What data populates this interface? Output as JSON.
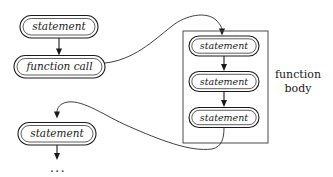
{
  "diagram": {
    "colors": {
      "stroke": "#1a1a1a",
      "group_stroke": "#4a4a4a",
      "background": "#ffffff"
    },
    "caller": {
      "nodes": [
        {
          "id": "caller-statement-1",
          "label": "statement",
          "kind": "statement"
        },
        {
          "id": "caller-function-call",
          "label": "function call",
          "kind": "call"
        },
        {
          "id": "caller-statement-2",
          "label": "statement",
          "kind": "statement"
        }
      ],
      "continuation": "..."
    },
    "callee": {
      "group_label_line1": "function",
      "group_label_line2": "body",
      "nodes": [
        {
          "id": "body-statement-1",
          "label": "statement",
          "kind": "statement"
        },
        {
          "id": "body-statement-2",
          "label": "statement",
          "kind": "statement"
        },
        {
          "id": "body-statement-3",
          "label": "statement",
          "kind": "statement"
        }
      ]
    },
    "edges": [
      {
        "id": "edge-stmt1-to-call",
        "type": "straight-arrow",
        "label": ""
      },
      {
        "id": "edge-call-into-body",
        "type": "curve-arrow",
        "label": ""
      },
      {
        "id": "edge-body1-to-body2",
        "type": "straight-arrow",
        "label": ""
      },
      {
        "id": "edge-body2-to-body3",
        "type": "straight-arrow",
        "label": ""
      },
      {
        "id": "edge-body-return",
        "type": "curve-arrow",
        "label": ""
      },
      {
        "id": "edge-stmt2-to-ellipsis",
        "type": "straight-arrow",
        "label": ""
      }
    ]
  }
}
